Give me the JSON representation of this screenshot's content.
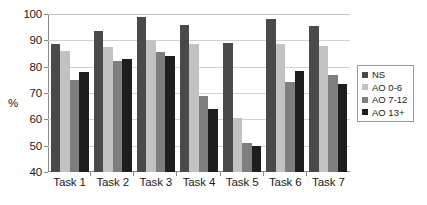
{
  "chart_data": {
    "type": "bar",
    "title": "",
    "xlabel": "",
    "ylabel": "%",
    "ylim": [
      40,
      100
    ],
    "ytick_step": 10,
    "yticks": [
      100,
      90,
      80,
      70,
      60,
      50,
      40
    ],
    "grid": true,
    "legend_position": "right",
    "categories": [
      "Task 1",
      "Task 2",
      "Task 3",
      "Task 4",
      "Task 5",
      "Task 6",
      "Task 7"
    ],
    "series": [
      {
        "name": "NS",
        "color": "#4a4a4a",
        "values": [
          88.5,
          93.5,
          99.0,
          96.0,
          89.0,
          98.0,
          95.5
        ]
      },
      {
        "name": "AO 0-6",
        "color": "#c2c2c2",
        "values": [
          86.0,
          87.5,
          90.0,
          88.5,
          60.5,
          88.5,
          88.0
        ]
      },
      {
        "name": "AO 7-12",
        "color": "#7e7e7e",
        "values": [
          75.0,
          82.0,
          85.5,
          69.0,
          51.0,
          74.0,
          77.0
        ]
      },
      {
        "name": "AO 13+",
        "color": "#1e1e1e",
        "values": [
          78.0,
          83.0,
          84.0,
          64.0,
          50.0,
          78.5,
          73.5
        ]
      }
    ]
  },
  "axis": {
    "y_title": "%"
  }
}
